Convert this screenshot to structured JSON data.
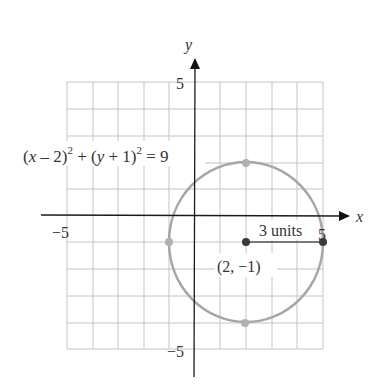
{
  "diagram": {
    "axes": {
      "x_label": "x",
      "y_label": "y",
      "x_tick_left": "−5",
      "x_tick_right": "5",
      "y_tick_top": "5",
      "y_tick_bottom": "−5",
      "range": [
        -5,
        5
      ]
    },
    "equation": {
      "part1": "(",
      "var_x": "x",
      "part2": " – 2)",
      "exp1": "2",
      "part3": " + (",
      "var_y": "y",
      "part4": " + 1)",
      "exp2": "2",
      "part5": " = 9"
    },
    "center": {
      "label": "(2, −1)",
      "x": 2,
      "y": -1
    },
    "radius": {
      "label": "3 units",
      "value": 3
    },
    "points": [
      {
        "name": "top",
        "x": 2,
        "y": 2
      },
      {
        "name": "bottom",
        "x": 2,
        "y": -4
      },
      {
        "name": "left",
        "x": -1,
        "y": -1
      },
      {
        "name": "right",
        "x": 5,
        "y": -1
      }
    ],
    "colors": {
      "axis": "#1a1a1a",
      "grid": "#bdbdbd",
      "circle": "#a6a6a6",
      "point_light": "#b0b0b0",
      "point_dark": "#3a3a3a"
    }
  }
}
